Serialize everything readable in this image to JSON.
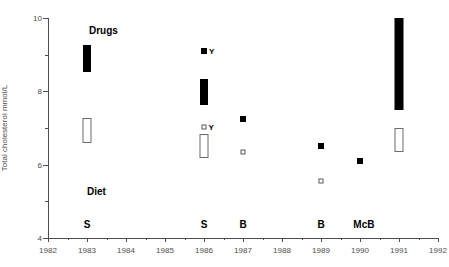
{
  "chart_data": {
    "type": "scatter",
    "title": "",
    "xlabel": "",
    "ylabel": "Total cholesterol mmol/L",
    "xlim": [
      1982,
      1992
    ],
    "ylim": [
      4,
      10
    ],
    "grid": false,
    "legend_position": "none",
    "x_ticks": [
      1982,
      1983,
      1984,
      1985,
      1986,
      1987,
      1988,
      1989,
      1990,
      1991,
      1992
    ],
    "x_tick_labels": [
      "1982",
      "1983",
      "1984",
      "1985",
      "1986",
      "1987",
      "1988",
      "1989",
      "1990",
      "1991",
      "1992"
    ],
    "y_ticks_major": [
      4,
      6,
      8,
      10
    ],
    "y_tick_labels": [
      "4",
      "6",
      "8",
      "10"
    ],
    "y_ticks_minor": [
      5,
      7,
      9
    ],
    "group_annotations": [
      {
        "text": "Drugs",
        "x": 1983.05,
        "y": 9.82
      },
      {
        "text": "Diet",
        "x": 1983.0,
        "y": 5.42
      }
    ],
    "study_labels": [
      {
        "text": "S",
        "x": 1983.0,
        "y": 4.53
      },
      {
        "text": "S",
        "x": 1986.0,
        "y": 4.53
      },
      {
        "text": "B",
        "x": 1987.0,
        "y": 4.53
      },
      {
        "text": "B",
        "x": 1989.0,
        "y": 4.53
      },
      {
        "text": "McB",
        "x": 1990.1,
        "y": 4.53
      }
    ],
    "series": [
      {
        "name": "Drugs (filled)",
        "style": "filled",
        "bars": [
          {
            "x": 1983.0,
            "y_low": 8.53,
            "y_high": 9.26,
            "width_px": 8
          },
          {
            "x": 1986.0,
            "y_low": 7.62,
            "y_high": 8.33,
            "width_px": 8
          },
          {
            "x": 1991.0,
            "y_low": 7.48,
            "y_high": 10.0,
            "width_px": 9
          }
        ],
        "points": [
          {
            "x": 1986.0,
            "y": 9.1,
            "size_px": 6,
            "label": "Y"
          },
          {
            "x": 1987.0,
            "y": 7.25,
            "size_px": 6,
            "label": ""
          },
          {
            "x": 1989.0,
            "y": 6.5,
            "size_px": 6,
            "label": ""
          },
          {
            "x": 1990.0,
            "y": 6.1,
            "size_px": 6,
            "label": ""
          }
        ]
      },
      {
        "name": "Diet (open)",
        "style": "open",
        "bars": [
          {
            "x": 1983.0,
            "y_low": 6.6,
            "y_high": 7.28,
            "width_px": 9
          },
          {
            "x": 1986.0,
            "y_low": 6.18,
            "y_high": 6.85,
            "width_px": 9
          },
          {
            "x": 1991.0,
            "y_low": 6.35,
            "y_high": 7.0,
            "width_px": 9
          }
        ],
        "points": [
          {
            "x": 1986.0,
            "y": 7.02,
            "size_px": 5,
            "label": "Y"
          },
          {
            "x": 1987.0,
            "y": 6.35,
            "size_px": 5,
            "label": ""
          },
          {
            "x": 1989.0,
            "y": 5.55,
            "size_px": 5,
            "label": ""
          }
        ]
      }
    ]
  }
}
